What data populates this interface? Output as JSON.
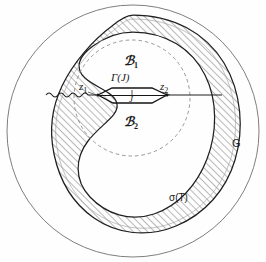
{
  "figure": {
    "background_color": "#fefefe",
    "ink_color": "#1a1a1a",
    "hatch_color": "#555555",
    "dash_color": "#777777"
  },
  "labels": {
    "domain_outer": "G",
    "spectrum": "σ(T)",
    "region_upper_main": "ℬ",
    "region_upper_sub": "1",
    "region_lower_main": "ℬ",
    "region_lower_sub": "2",
    "contour_main": "Γ(J)",
    "cut": "J",
    "point_left_main": "z",
    "point_left_sub": "1",
    "point_right_main": "z",
    "point_right_sub": "2"
  },
  "geometry": {
    "outer_circle": {
      "cx": 133,
      "cy": 131,
      "r": 126
    },
    "dashed_circle": {
      "cx": 132,
      "cy": 98,
      "r": 58
    },
    "contour_left_point": {
      "x": 98,
      "y": 95
    },
    "contour_right_point": {
      "x": 167,
      "y": 95
    },
    "cut_line_y": 95
  },
  "annotation_positions": {
    "domain_outer": {
      "left": 232,
      "top": 139
    },
    "spectrum": {
      "left": 170,
      "top": 194
    },
    "region_upper": {
      "left": 124,
      "top": 56
    },
    "region_lower": {
      "left": 124,
      "top": 117
    },
    "contour": {
      "left": 112,
      "top": 74
    },
    "cut": {
      "left": 128,
      "top": 95
    },
    "point_left": {
      "left": 80,
      "top": 82
    },
    "point_right": {
      "left": 160,
      "top": 82
    }
  }
}
